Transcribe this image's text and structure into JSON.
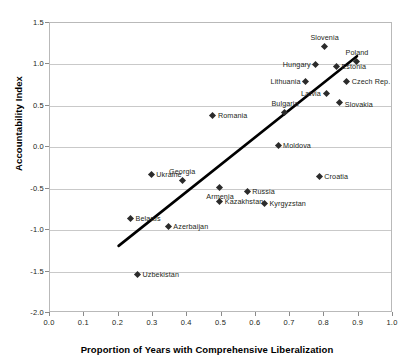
{
  "chart_data": {
    "type": "scatter",
    "title": "",
    "xlabel": "Proportion of Years with Comprehensive Liberalization",
    "ylabel": "Accountability Index",
    "xlim": [
      0.0,
      1.0
    ],
    "ylim": [
      -2.0,
      1.5
    ],
    "xticks": [
      "0.0",
      "0.1",
      "0.2",
      "0.3",
      "0.4",
      "0.5",
      "0.6",
      "0.7",
      "0.8",
      "0.9",
      "1.0"
    ],
    "xtick_values": [
      0.0,
      0.1,
      0.2,
      0.3,
      0.4,
      0.5,
      0.6,
      0.7,
      0.8,
      0.9,
      1.0
    ],
    "yticks": [
      "1.5",
      "1.0",
      "0.5",
      "0.0",
      "-0.5",
      "-1.0",
      "-1.5",
      "-2.0"
    ],
    "ytick_values": [
      1.5,
      1.0,
      0.5,
      0.0,
      -0.5,
      -1.0,
      -1.5,
      -2.0
    ],
    "grid": true,
    "grid_axis": "y",
    "legend": "none",
    "marker_color": "#2b2b2b",
    "trendline_color": "#000000",
    "frame_color": "#b9b9b9",
    "points": [
      {
        "label": "Slovenia",
        "x": 0.8,
        "y": 1.22,
        "label_dx": 0,
        "label_dy": -9,
        "label_anchor": "center"
      },
      {
        "label": "Poland",
        "x": 0.895,
        "y": 1.04,
        "label_dx": 0,
        "label_dy": -9,
        "label_anchor": "center"
      },
      {
        "label": "Hungary",
        "x": 0.775,
        "y": 1.0,
        "label_dx": -5,
        "label_dy": 0,
        "label_anchor": "right"
      },
      {
        "label": "Estonia",
        "x": 0.835,
        "y": 0.98,
        "label_dx": 5,
        "label_dy": 0,
        "label_anchor": "left"
      },
      {
        "label": "Lithuania",
        "x": 0.745,
        "y": 0.79,
        "label_dx": -5,
        "label_dy": 0,
        "label_anchor": "right"
      },
      {
        "label": "Czech Rep.",
        "x": 0.865,
        "y": 0.79,
        "label_dx": 5,
        "label_dy": 0,
        "label_anchor": "left"
      },
      {
        "label": "Latvia",
        "x": 0.805,
        "y": 0.65,
        "label_dx": -5,
        "label_dy": 0,
        "label_anchor": "right"
      },
      {
        "label": "Slovakia",
        "x": 0.845,
        "y": 0.545,
        "label_dx": 5,
        "label_dy": 2,
        "label_anchor": "left"
      },
      {
        "label": "Bulgaria",
        "x": 0.685,
        "y": 0.415,
        "label_dx": 0,
        "label_dy": -9,
        "label_anchor": "center"
      },
      {
        "label": "Romania",
        "x": 0.475,
        "y": 0.385,
        "label_dx": 5,
        "label_dy": 0,
        "label_anchor": "left"
      },
      {
        "label": "Moldova",
        "x": 0.665,
        "y": 0.02,
        "label_dx": 5,
        "label_dy": 0,
        "label_anchor": "left"
      },
      {
        "label": "Ukraine",
        "x": 0.295,
        "y": -0.33,
        "label_dx": 5,
        "label_dy": 0,
        "label_anchor": "left"
      },
      {
        "label": "Georgia",
        "x": 0.385,
        "y": -0.4,
        "label_dx": 0,
        "label_dy": -9,
        "label_anchor": "center"
      },
      {
        "label": "Croatia",
        "x": 0.785,
        "y": -0.35,
        "label_dx": 5,
        "label_dy": 0,
        "label_anchor": "left"
      },
      {
        "label": "Armenia",
        "x": 0.495,
        "y": -0.48,
        "label_dx": 0,
        "label_dy": 9,
        "label_anchor": "center"
      },
      {
        "label": "Russia",
        "x": 0.575,
        "y": -0.53,
        "label_dx": 5,
        "label_dy": 0,
        "label_anchor": "left"
      },
      {
        "label": "Kazakhstan",
        "x": 0.495,
        "y": -0.655,
        "label_dx": 5,
        "label_dy": 0,
        "label_anchor": "left"
      },
      {
        "label": "Kyrgyzstan",
        "x": 0.625,
        "y": -0.675,
        "label_dx": 5,
        "label_dy": 0,
        "label_anchor": "left"
      },
      {
        "label": "Belarus",
        "x": 0.235,
        "y": -0.86,
        "label_dx": 5,
        "label_dy": 0,
        "label_anchor": "left"
      },
      {
        "label": "Azerbaijan",
        "x": 0.345,
        "y": -0.95,
        "label_dx": 5,
        "label_dy": 0,
        "label_anchor": "left"
      },
      {
        "label": "Uzbekistan",
        "x": 0.255,
        "y": -1.53,
        "label_dx": 5,
        "label_dy": 0,
        "label_anchor": "left"
      }
    ],
    "trendline": {
      "x0": 0.2,
      "y0": -1.19,
      "x1": 0.895,
      "y1": 1.1
    }
  }
}
